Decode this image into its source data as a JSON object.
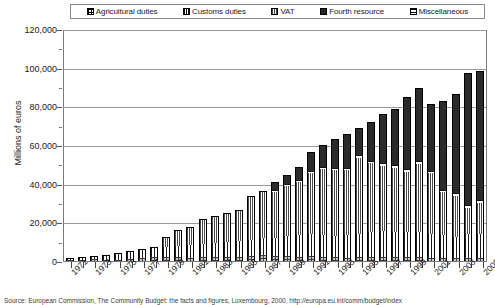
{
  "legend": {
    "position": "top",
    "items": [
      {
        "label": "Agricultural duties",
        "icon": "swatch-crosshatch",
        "key": "agricultural"
      },
      {
        "label": "Customs duties",
        "icon": "swatch-vertical-lines",
        "key": "customs"
      },
      {
        "label": "VAT",
        "icon": "swatch-fine-grid",
        "key": "vat"
      },
      {
        "label": "Fourth resource",
        "icon": "swatch-solid-black",
        "key": "fourth"
      },
      {
        "label": "Miscellaneous",
        "icon": "swatch-horizontal-lines",
        "key": "misc"
      }
    ]
  },
  "axis": {
    "ylabel": "Millions of euros",
    "yticks": [
      "0",
      "20,000",
      "40,000",
      "60,000",
      "80,000",
      "100,000",
      "120,000"
    ]
  },
  "source": "Source: European Commission, The Community Budget: the facts and figures, Luxembourg, 2000, http://europa.eu.int/comm/budget/index",
  "chart_data": {
    "type": "bar",
    "subtype": "stacked",
    "title": "",
    "xlabel": "",
    "ylabel": "Millions of euros",
    "ylim": [
      0,
      120000
    ],
    "ytick_step": 20000,
    "grid": true,
    "legend_position": "top",
    "categories": [
      "1971",
      "1972",
      "1973",
      "1974",
      "1975",
      "1976",
      "1977",
      "1978",
      "1979",
      "1980",
      "1981",
      "1982",
      "1983",
      "1984",
      "1985",
      "1986",
      "1987",
      "1988",
      "1989",
      "1990",
      "1991",
      "1992",
      "1993",
      "1994",
      "1995",
      "1996",
      "1997",
      "1998",
      "1999",
      "2000",
      "2001",
      "2002",
      "2003",
      "2004",
      "2005"
    ],
    "tick_labels": [
      "1971",
      "",
      "1973",
      "",
      "1975",
      "",
      "1977",
      "",
      "1979",
      "",
      "1981",
      "",
      "1983",
      "",
      "1985",
      "",
      "1987",
      "",
      "1989",
      "",
      "1991",
      "",
      "1993",
      "",
      "1995",
      "",
      "1997",
      "",
      "1999",
      "",
      "2001",
      "",
      "2003",
      "",
      "2005"
    ],
    "series": [
      {
        "name": "Agricultural duties",
        "values": [
          700,
          750,
          800,
          350,
          600,
          1150,
          1550,
          2300,
          1900,
          2000,
          1650,
          2200,
          2300,
          2100,
          2200,
          2600,
          3100,
          2600,
          2400,
          2100,
          2500,
          2100,
          1900,
          1800,
          2000,
          2000,
          2100,
          2200,
          2300,
          2200,
          1800,
          1800,
          1500,
          1700,
          1600
        ]
      },
      {
        "name": "Customs duties",
        "values": [
          600,
          900,
          1200,
          2200,
          2800,
          3400,
          3900,
          4400,
          5200,
          5900,
          6400,
          6800,
          7200,
          7700,
          8300,
          8200,
          8700,
          9300,
          10300,
          11400,
          11500,
          11300,
          11000,
          11800,
          12200,
          13000,
          13400,
          13000,
          12700,
          13000,
          12300,
          11500,
          11000,
          12200,
          12500
        ]
      },
      {
        "name": "VAT",
        "values": [
          0,
          0,
          0,
          0,
          0,
          0,
          0,
          0,
          4700,
          7500,
          9100,
          12100,
          13300,
          14300,
          15200,
          22100,
          23700,
          23800,
          26200,
          27400,
          31400,
          34100,
          34100,
          33400,
          39200,
          35700,
          33600,
          33100,
          31200,
          35200,
          31300,
          22400,
          21300,
          13600,
          16000
        ]
      },
      {
        "name": "Fourth resource",
        "values": [
          0,
          0,
          0,
          0,
          0,
          0,
          0,
          0,
          0,
          0,
          0,
          0,
          0,
          0,
          0,
          0,
          0,
          4500,
          4500,
          6600,
          9900,
          11200,
          15000,
          17700,
          14200,
          19800,
          25300,
          29100,
          37500,
          37600,
          34800,
          45900,
          51200,
          68600,
          66700
        ]
      },
      {
        "name": "Miscellaneous",
        "values": [
          100,
          150,
          200,
          300,
          300,
          400,
          500,
          600,
          500,
          500,
          600,
          700,
          700,
          700,
          800,
          1000,
          900,
          900,
          1000,
          1100,
          1100,
          1200,
          1200,
          1200,
          1300,
          1300,
          1400,
          1400,
          1300,
          1300,
          1300,
          1200,
          1300,
          1400,
          1500
        ]
      },
      {
        "name": "Total",
        "values": [
          1400,
          1800,
          2200,
          2850,
          3700,
          4950,
          5950,
          7300,
          12300,
          15900,
          17750,
          21800,
          23500,
          24800,
          26500,
          33900,
          36400,
          41100,
          44400,
          48600,
          56400,
          59900,
          63200,
          65900,
          68900,
          71800,
          75800,
          78800,
          85000,
          89300,
          81500,
          82800,
          86300,
          97500,
          98300
        ]
      }
    ]
  }
}
